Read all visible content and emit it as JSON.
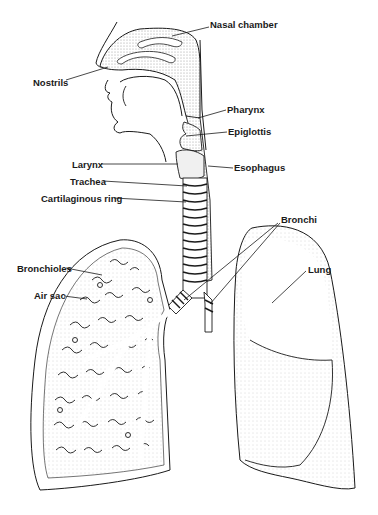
{
  "diagram": {
    "colors": {
      "ink": "#1a1a1a",
      "stipple": "#d9d9d9",
      "background": "#ffffff"
    },
    "labels": [
      {
        "id": "nasal-chamber",
        "text": "Nasal chamber",
        "x": 210,
        "y": 19
      },
      {
        "id": "nostrils",
        "text": "Nostrils",
        "x": 33,
        "y": 77
      },
      {
        "id": "pharynx",
        "text": "Pharynx",
        "x": 227,
        "y": 104
      },
      {
        "id": "epiglottis",
        "text": "Epiglottis",
        "x": 228,
        "y": 126
      },
      {
        "id": "larynx",
        "text": "Larynx",
        "x": 72,
        "y": 159
      },
      {
        "id": "esophagus",
        "text": "Esophagus",
        "x": 234,
        "y": 162
      },
      {
        "id": "trachea",
        "text": "Trachea",
        "x": 70,
        "y": 176
      },
      {
        "id": "cartilaginous-ring",
        "text": "Cartilaginous ring",
        "x": 41,
        "y": 193
      },
      {
        "id": "bronchi",
        "text": "Bronchi",
        "x": 281,
        "y": 214
      },
      {
        "id": "bronchioles",
        "text": "Bronchioles",
        "x": 17,
        "y": 263
      },
      {
        "id": "air-sac",
        "text": "Air sac",
        "x": 34,
        "y": 290
      },
      {
        "id": "lung",
        "text": "Lung",
        "x": 308,
        "y": 264
      }
    ]
  }
}
